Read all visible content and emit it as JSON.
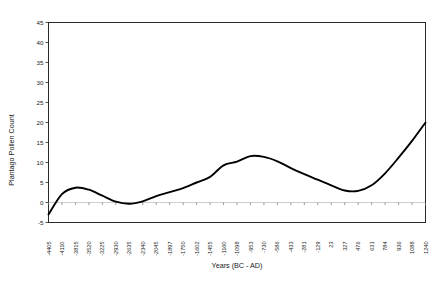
{
  "chart_data": {
    "type": "line",
    "title": "",
    "xlabel": "Years (BC - AD)",
    "ylabel": "Plantago Pollen Count",
    "ylim": [
      -5,
      45
    ],
    "yticks": [
      -5,
      0,
      5,
      10,
      15,
      20,
      25,
      30,
      35,
      40,
      45
    ],
    "ytick_labels": [
      "-5",
      "0",
      "5",
      "10",
      "15",
      "20",
      "25",
      "30",
      "35",
      "40",
      "45"
    ],
    "grid": false,
    "legend": "none",
    "categories": [
      "-4405",
      "-4110",
      "-3815",
      "-3520",
      "-3225",
      "-2930",
      "-2635",
      "-2340",
      "-2045",
      "-1897",
      "-1750",
      "-1602",
      "-1455",
      "-1160",
      "-1098",
      "-953",
      "-730",
      "-586",
      "-433",
      "-281",
      "-129",
      "23",
      "327",
      "476",
      "631",
      "784",
      "936",
      "1088",
      "1240"
    ],
    "values": [
      -3.0,
      2.1,
      3.7,
      3.2,
      1.7,
      0.2,
      -0.3,
      0.3,
      1.6,
      2.6,
      3.6,
      5.0,
      6.4,
      9.3,
      10.2,
      11.6,
      11.4,
      10.3,
      8.6,
      7.1,
      5.7,
      4.3,
      3.0,
      2.9,
      4.3,
      7.3,
      11.2,
      15.4,
      20.0
    ],
    "series_name": "Plantago Pollen Count",
    "line_color": "#000000"
  },
  "axes": {
    "y_title": "Plantago Pollen Count",
    "x_title": "Years (BC - AD)"
  }
}
